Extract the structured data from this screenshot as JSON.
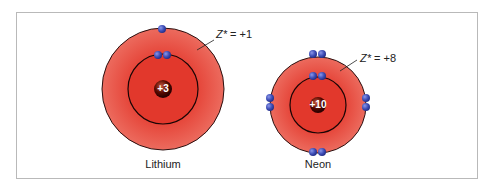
{
  "figure": {
    "atoms": [
      {
        "name": "Lithium",
        "nucleus_charge": "+3",
        "z_eff_label": "Z* = +1",
        "z_symbol": "Z*",
        "z_value": "= +1",
        "inner_electrons": 2,
        "outer_electrons": 1
      },
      {
        "name": "Neon",
        "nucleus_charge": "+10",
        "z_eff_label": "Z* = +8",
        "z_symbol": "Z*",
        "z_value": "= +8",
        "inner_electrons": 2,
        "outer_electrons": 8
      }
    ],
    "colors": {
      "shell": "#e0433a",
      "shell_light": "#ec6a5c",
      "electron": "#3f4fb8",
      "nucleus": "#5a0a00",
      "border": "#b9b9b9"
    }
  }
}
